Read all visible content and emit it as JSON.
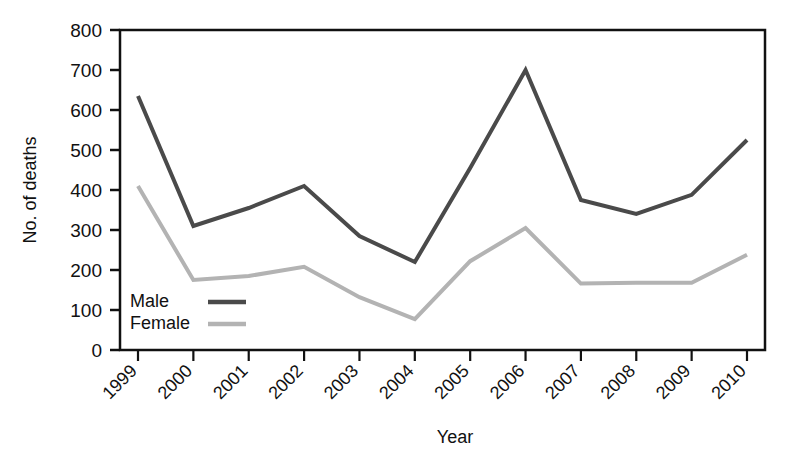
{
  "chart_data": {
    "type": "line",
    "title": "",
    "xlabel": "Year",
    "ylabel": "No. of deaths",
    "categories": [
      "1999",
      "2000",
      "2001",
      "2002",
      "2003",
      "2004",
      "2005",
      "2006",
      "2007",
      "2008",
      "2009",
      "2010"
    ],
    "x": [
      1999,
      2000,
      2001,
      2002,
      2003,
      2004,
      2005,
      2006,
      2007,
      2008,
      2009,
      2010
    ],
    "series": [
      {
        "name": "Male",
        "color": "#4a4a4a",
        "values": [
          635,
          310,
          355,
          410,
          285,
          220,
          455,
          700,
          375,
          340,
          388,
          525
        ]
      },
      {
        "name": "Female",
        "color": "#b3b3b3",
        "values": [
          410,
          175,
          185,
          208,
          132,
          77,
          222,
          305,
          166,
          168,
          168,
          238
        ]
      }
    ],
    "ylim": [
      0,
      800
    ],
    "yticks": [
      0,
      100,
      200,
      300,
      400,
      500,
      600,
      700,
      800
    ],
    "ytick_labels": [
      "0",
      "100",
      "200",
      "300",
      "400",
      "500",
      "600",
      "700",
      "800"
    ],
    "xtick_labels": [
      "1999",
      "2000",
      "2001",
      "2002",
      "2003",
      "2004",
      "2005",
      "2006",
      "2007",
      "2008",
      "2009",
      "2010"
    ],
    "xtick_rotation_deg": 45,
    "grid": false,
    "legend_position": "inside-bottom-left",
    "axis_color": "#111111",
    "background_color": "#ffffff"
  },
  "axes": {
    "y_title": "No. of deaths",
    "x_title": "Year"
  },
  "legend": {
    "entries": [
      {
        "label": "Male",
        "color": "#4a4a4a"
      },
      {
        "label": "Female",
        "color": "#b3b3b3"
      }
    ]
  }
}
